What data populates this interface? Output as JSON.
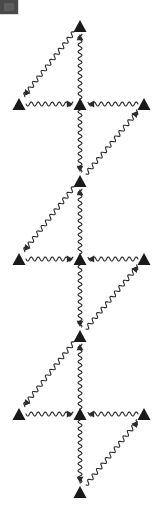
{
  "canvas": {
    "width": 166,
    "height": 521,
    "background": "#ffffff",
    "ink": "#1a1a1a"
  },
  "corner_badge": {
    "name": "corner-badge",
    "color": "#4a4a4a",
    "label": ""
  },
  "diagram": {
    "title": "",
    "type": "feynman-diagram",
    "line_style": "wavy",
    "vertex_shape": "filled-triangle",
    "vertex_color": "#1a1a1a",
    "stroke_color": "#2b2b2b",
    "stroke_width": 1.1,
    "wave_amplitude": 2.0,
    "wave_period": 7.0,
    "center_x": 80,
    "left_x": 19,
    "right_x": 144,
    "motif_count": 3,
    "motifs": [
      {
        "name": "motif-1",
        "row_y": 104,
        "top_y": 26,
        "bottom_y": 178
      },
      {
        "name": "motif-2",
        "row_y": 259,
        "top_y": 181,
        "bottom_y": 333
      },
      {
        "name": "motif-3",
        "row_y": 414,
        "top_y": 336,
        "bottom_y": 492
      }
    ],
    "vertices": [
      {
        "id": "v-top",
        "x": 80,
        "y": 26,
        "size": 13,
        "dir": "up"
      },
      {
        "id": "v-left-1",
        "x": 19,
        "y": 104,
        "size": 13,
        "dir": "up"
      },
      {
        "id": "v-center-1",
        "x": 80,
        "y": 104,
        "size": 13,
        "dir": "up"
      },
      {
        "id": "v-right-1",
        "x": 144,
        "y": 104,
        "size": 13,
        "dir": "up"
      },
      {
        "id": "v-mid-1",
        "x": 80,
        "y": 181,
        "size": 13,
        "dir": "up"
      },
      {
        "id": "v-left-2",
        "x": 19,
        "y": 259,
        "size": 13,
        "dir": "up"
      },
      {
        "id": "v-center-2",
        "x": 80,
        "y": 259,
        "size": 13,
        "dir": "up"
      },
      {
        "id": "v-right-2",
        "x": 144,
        "y": 259,
        "size": 13,
        "dir": "up"
      },
      {
        "id": "v-mid-2",
        "x": 80,
        "y": 336,
        "size": 13,
        "dir": "up"
      },
      {
        "id": "v-left-3",
        "x": 19,
        "y": 414,
        "size": 13,
        "dir": "up"
      },
      {
        "id": "v-center-3",
        "x": 80,
        "y": 414,
        "size": 13,
        "dir": "up"
      },
      {
        "id": "v-right-3",
        "x": 144,
        "y": 414,
        "size": 13,
        "dir": "up"
      },
      {
        "id": "v-bottom",
        "x": 80,
        "y": 492,
        "size": 13,
        "dir": "up"
      }
    ],
    "edges": [
      {
        "id": "e1",
        "from": [
          80,
          99
        ],
        "to": [
          80,
          34
        ],
        "arrow": "end",
        "note": "center-1 up to top"
      },
      {
        "id": "e2",
        "from": [
          74,
          32
        ],
        "to": [
          24,
          96
        ],
        "arrow": "end",
        "note": "top down-left"
      },
      {
        "id": "e3",
        "from": [
          26,
          104
        ],
        "to": [
          73,
          104
        ],
        "arrow": "end",
        "note": "left-1 to center-1"
      },
      {
        "id": "e4",
        "from": [
          138,
          104
        ],
        "to": [
          88,
          104
        ],
        "arrow": "end",
        "note": "right-1 to center-1"
      },
      {
        "id": "e5",
        "from": [
          80,
          110
        ],
        "to": [
          80,
          172
        ],
        "arrow": "end",
        "note": "center-1 down"
      },
      {
        "id": "e6",
        "from": [
          86,
          174
        ],
        "to": [
          138,
          111
        ],
        "arrow": "end",
        "note": "up-right to right-1"
      },
      {
        "id": "e7",
        "from": [
          80,
          254
        ],
        "to": [
          80,
          189
        ],
        "arrow": "end",
        "note": "center-2 up to mid-1"
      },
      {
        "id": "e8",
        "from": [
          74,
          187
        ],
        "to": [
          24,
          251
        ],
        "arrow": "end",
        "note": "mid-1 down-left"
      },
      {
        "id": "e9",
        "from": [
          26,
          259
        ],
        "to": [
          73,
          259
        ],
        "arrow": "end",
        "note": "left-2 to center-2"
      },
      {
        "id": "e10",
        "from": [
          138,
          259
        ],
        "to": [
          88,
          259
        ],
        "arrow": "end",
        "note": "right-2 to center-2"
      },
      {
        "id": "e11",
        "from": [
          80,
          265
        ],
        "to": [
          80,
          327
        ],
        "arrow": "end",
        "note": "center-2 down"
      },
      {
        "id": "e12",
        "from": [
          86,
          329
        ],
        "to": [
          138,
          266
        ],
        "arrow": "end",
        "note": "up-right to right-2"
      },
      {
        "id": "e13",
        "from": [
          80,
          409
        ],
        "to": [
          80,
          344
        ],
        "arrow": "end",
        "note": "center-3 up to mid-2"
      },
      {
        "id": "e14",
        "from": [
          74,
          342
        ],
        "to": [
          24,
          406
        ],
        "arrow": "end",
        "note": "mid-2 down-left"
      },
      {
        "id": "e15",
        "from": [
          26,
          414
        ],
        "to": [
          73,
          414
        ],
        "arrow": "end",
        "note": "left-3 to center-3"
      },
      {
        "id": "e16",
        "from": [
          138,
          414
        ],
        "to": [
          88,
          414
        ],
        "arrow": "end",
        "note": "right-3 to center-3"
      },
      {
        "id": "e17",
        "from": [
          80,
          420
        ],
        "to": [
          80,
          483
        ],
        "arrow": "end",
        "note": "center-3 down to bottom"
      },
      {
        "id": "e18",
        "from": [
          86,
          485
        ],
        "to": [
          138,
          421
        ],
        "arrow": "end",
        "note": "up-right to right-3"
      }
    ]
  }
}
